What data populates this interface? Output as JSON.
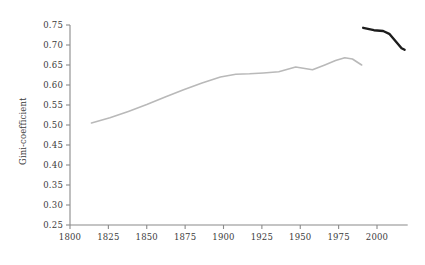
{
  "chart_data": {
    "type": "line",
    "title": "",
    "xlabel": "",
    "ylabel": "Gini-coefficient",
    "xlim": [
      1795,
      2020
    ],
    "ylim": [
      0.25,
      0.75
    ],
    "grid": false,
    "legend_position": "none",
    "xticks": [
      1800,
      1825,
      1850,
      1875,
      1900,
      1925,
      1950,
      1975,
      2000
    ],
    "xtick_labels": [
      "1800",
      "1825",
      "1850",
      "1875",
      "1900",
      "1925",
      "1950",
      "1975",
      "2000"
    ],
    "yticks": [
      0.25,
      0.3,
      0.35,
      0.4,
      0.45,
      0.5,
      0.55,
      0.6,
      0.65,
      0.7,
      0.75
    ],
    "ytick_labels": [
      "0.25",
      "0.30",
      "0.35",
      "0.40",
      "0.45",
      "0.50",
      "0.55",
      "0.60",
      "0.65",
      "0.70",
      "0.75"
    ],
    "series": [
      {
        "name": "historical-estimate",
        "color": "#b9b9b9",
        "width": 1.6,
        "points": [
          [
            1814,
            0.505
          ],
          [
            1826,
            0.518
          ],
          [
            1838,
            0.534
          ],
          [
            1850,
            0.551
          ],
          [
            1862,
            0.57
          ],
          [
            1874,
            0.588
          ],
          [
            1886,
            0.605
          ],
          [
            1898,
            0.62
          ],
          [
            1908,
            0.627
          ],
          [
            1917,
            0.628
          ],
          [
            1926,
            0.63
          ],
          [
            1936,
            0.633
          ],
          [
            1947,
            0.645
          ],
          [
            1952,
            0.642
          ],
          [
            1958,
            0.638
          ],
          [
            1966,
            0.65
          ],
          [
            1973,
            0.661
          ],
          [
            1979,
            0.668
          ],
          [
            1984,
            0.665
          ],
          [
            1990,
            0.65
          ]
        ]
      },
      {
        "name": "recent-series",
        "color": "#1c1c1c",
        "width": 2.4,
        "points": [
          [
            1991,
            0.743
          ],
          [
            1998,
            0.737
          ],
          [
            2004,
            0.735
          ],
          [
            2008,
            0.728
          ],
          [
            2012,
            0.71
          ],
          [
            2016,
            0.692
          ],
          [
            2018,
            0.688
          ]
        ]
      }
    ],
    "axis_color": "#8a8a8a",
    "text_color": "#3c3c3c"
  }
}
